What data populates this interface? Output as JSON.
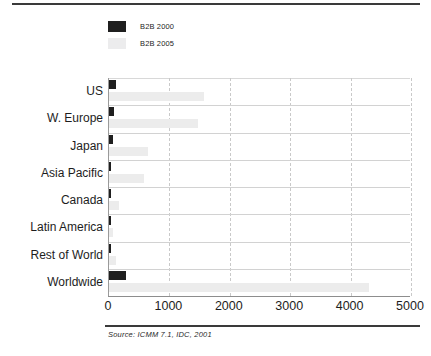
{
  "chart_data": {
    "type": "bar",
    "orientation": "horizontal",
    "title": "",
    "xlabel": "",
    "ylabel": "",
    "xlim": [
      0,
      5000
    ],
    "xticks": [
      "0",
      "1000",
      "2000",
      "3000",
      "4000",
      "5000"
    ],
    "grid": "vertical-dashed-and-horizontal-solid",
    "legend_position": "top-left",
    "categories": [
      "US",
      "W. Europe",
      "Japan",
      "Asia Pacific",
      "Canada",
      "Latin America",
      "Rest of World",
      "Worldwide"
    ],
    "series": [
      {
        "name": "B2B 2000",
        "color": "#1f1f1f",
        "values": [
          120,
          90,
          65,
          25,
          15,
          8,
          10,
          280
        ]
      },
      {
        "name": "B2B 2005",
        "color": "#ececec",
        "values": [
          1570,
          1480,
          640,
          580,
          170,
          70,
          120,
          4300
        ]
      }
    ],
    "source": "Source: ICMM 7.1, IDC, 2001"
  },
  "legend": {
    "items": [
      {
        "label": "B2B 2000",
        "swatch": "dark"
      },
      {
        "label": "B2B 2005",
        "swatch": "light"
      }
    ]
  },
  "footer": {
    "source_text": "Source: ICMM 7.1, IDC, 2001"
  }
}
